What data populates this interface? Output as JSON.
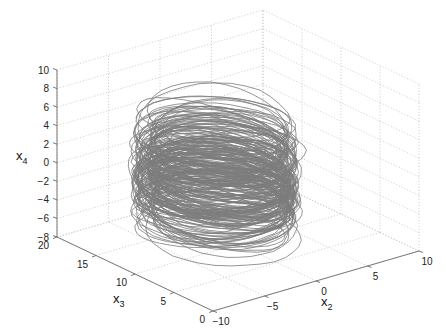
{
  "chart_data": {
    "type": "line3d",
    "title": "",
    "xlabel": "x_2",
    "ylabel": "x_3",
    "zlabel": "x_4",
    "axes": {
      "x2": {
        "label_main": "x",
        "label_sub": "2",
        "range": [
          -10,
          10
        ],
        "ticks": [
          -10,
          -5,
          0,
          5,
          10
        ]
      },
      "x3": {
        "label_main": "x",
        "label_sub": "3",
        "range": [
          0,
          20
        ],
        "ticks": [
          0,
          5,
          10,
          15,
          20
        ]
      },
      "x4": {
        "label_main": "x",
        "label_sub": "4",
        "range": [
          -8,
          10
        ],
        "ticks": [
          -8,
          -6,
          -4,
          -2,
          0,
          2,
          4,
          6,
          8,
          10
        ]
      }
    },
    "grid": true,
    "legend": null,
    "series": [
      {
        "name": "trajectory",
        "description": "Chaotic attractor trajectory, dense coils centered near x2≈-2, x3≈10, x4 spanning about -7 to 7",
        "color": "#7c7c7c",
        "center": {
          "x2": -2,
          "x3": 10,
          "x4": 0
        },
        "x4_extent": [
          -7,
          7
        ]
      }
    ],
    "view": {
      "azimuth_deg": -37.5,
      "elevation_deg": 30
    }
  },
  "colors": {
    "background": "#ffffff",
    "grid": "#c8c8c8",
    "axis": "#6a6a6a",
    "trajectory": "#7c7c7c"
  }
}
